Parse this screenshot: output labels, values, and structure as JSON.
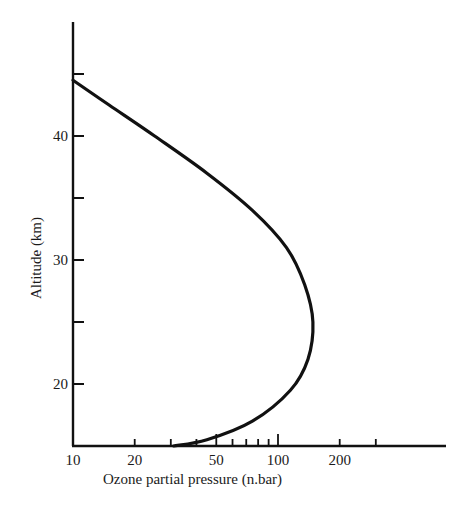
{
  "chart_data": {
    "type": "line",
    "title": "",
    "xlabel": "Ozone partial pressure (n.bar)",
    "ylabel": "Altitude (km)",
    "xscale": "log",
    "xlim": [
      10,
      500
    ],
    "ylim": [
      15,
      48
    ],
    "grid": false,
    "legend": null,
    "x_tick_labels": [
      "10",
      "20",
      "50",
      "100",
      "200"
    ],
    "x_tick_values": [
      10,
      20,
      30,
      40,
      50,
      60,
      70,
      80,
      90,
      100,
      200,
      300
    ],
    "y_tick_labels": [
      "20",
      "30",
      "40"
    ],
    "y_tick_values": [
      20,
      25,
      30,
      35,
      40,
      45
    ],
    "series": [
      {
        "name": "Ozone profile",
        "color": "#111111",
        "points": [
          {
            "x": 10,
            "y": 44.5
          },
          {
            "x": 15,
            "y": 42.5
          },
          {
            "x": 25,
            "y": 40
          },
          {
            "x": 45,
            "y": 37
          },
          {
            "x": 75,
            "y": 34
          },
          {
            "x": 110,
            "y": 31
          },
          {
            "x": 135,
            "y": 28
          },
          {
            "x": 148,
            "y": 25
          },
          {
            "x": 140,
            "y": 22
          },
          {
            "x": 115,
            "y": 19.5
          },
          {
            "x": 75,
            "y": 17
          },
          {
            "x": 45,
            "y": 15.5
          },
          {
            "x": 31,
            "y": 15
          }
        ]
      }
    ]
  }
}
